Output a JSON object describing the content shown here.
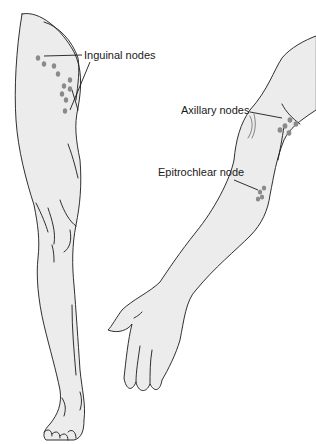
{
  "figure": {
    "labels": {
      "inguinal": "Inguinal nodes",
      "axillary": "Axillary nodes",
      "epitrochlear": "Epitrochlear node"
    }
  },
  "colors": {
    "skin_fill": "#ececec",
    "outline": "#1a1a1a",
    "node": "#8a8a8a",
    "background": "#ffffff"
  }
}
